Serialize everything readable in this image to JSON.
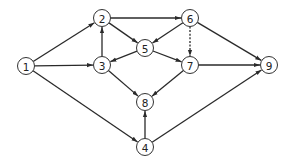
{
  "diagram": {
    "type": "directed-graph",
    "colors": {
      "stroke": "#2a2a2a",
      "node_fill": "#ffffff",
      "text": "#222222"
    },
    "nodes": [
      {
        "id": "1",
        "label": "1"
      },
      {
        "id": "2",
        "label": "2"
      },
      {
        "id": "3",
        "label": "3"
      },
      {
        "id": "4",
        "label": "4"
      },
      {
        "id": "5",
        "label": "5"
      },
      {
        "id": "6",
        "label": "6"
      },
      {
        "id": "7",
        "label": "7"
      },
      {
        "id": "8",
        "label": "8"
      },
      {
        "id": "9",
        "label": "9"
      }
    ],
    "edges": [
      {
        "from": "1",
        "to": "2",
        "style": "solid"
      },
      {
        "from": "1",
        "to": "3",
        "style": "solid"
      },
      {
        "from": "1",
        "to": "4",
        "style": "solid"
      },
      {
        "from": "3",
        "to": "2",
        "style": "solid"
      },
      {
        "from": "2",
        "to": "6",
        "style": "solid"
      },
      {
        "from": "2",
        "to": "5",
        "style": "solid"
      },
      {
        "from": "5",
        "to": "3",
        "style": "solid"
      },
      {
        "from": "6",
        "to": "5",
        "style": "solid"
      },
      {
        "from": "6",
        "to": "7",
        "style": "dashed"
      },
      {
        "from": "6",
        "to": "9",
        "style": "solid"
      },
      {
        "from": "5",
        "to": "7",
        "style": "solid"
      },
      {
        "from": "7",
        "to": "9",
        "style": "solid"
      },
      {
        "from": "3",
        "to": "8",
        "style": "solid"
      },
      {
        "from": "7",
        "to": "8",
        "style": "solid"
      },
      {
        "from": "4",
        "to": "8",
        "style": "solid"
      },
      {
        "from": "4",
        "to": "9",
        "style": "solid"
      }
    ]
  }
}
